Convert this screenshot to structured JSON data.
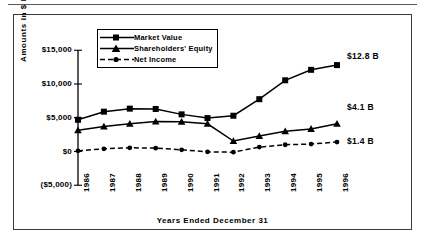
{
  "chart_data": {
    "type": "line",
    "title": "",
    "xlabel": "Years Ended December 31",
    "ylabel": "Amounts  in  $  Millions",
    "categories": [
      "1986",
      "1987",
      "1988",
      "1989",
      "1990",
      "1991",
      "1992",
      "1993",
      "1994",
      "1995",
      "1996"
    ],
    "ylim": [
      -5000,
      15000
    ],
    "yticks": [
      -5000,
      0,
      5000,
      10000,
      15000
    ],
    "ytick_labels": [
      "($5,000)",
      "$0",
      "$5,000",
      "$10,000",
      "$15,000"
    ],
    "grid": false,
    "legend_position": "top-left",
    "series": [
      {
        "name": "Market Value",
        "marker": "square",
        "line_style": "solid",
        "values": [
          4700,
          5900,
          6350,
          6300,
          5500,
          4950,
          5300,
          7750,
          10550,
          12100,
          12800
        ]
      },
      {
        "name": "Shareholders' Equity",
        "marker": "triangle",
        "line_style": "solid",
        "values": [
          3150,
          3700,
          4100,
          4450,
          4400,
          4100,
          1550,
          2300,
          3000,
          3350,
          4100
        ]
      },
      {
        "name": "Net Income",
        "marker": "circle",
        "line_style": "dashed",
        "values": [
          100,
          400,
          550,
          500,
          250,
          -50,
          -100,
          650,
          1000,
          1100,
          1400
        ]
      }
    ],
    "annotations": [
      {
        "text": "$12.8 B",
        "series": "Market Value",
        "at_category": "1996"
      },
      {
        "text": "$4.1 B",
        "series": "Shareholders' Equity",
        "at_category": "1996"
      },
      {
        "text": "$1.4 B",
        "series": "Net Income",
        "at_category": "1996"
      }
    ]
  },
  "legend": {
    "items": [
      {
        "label": "Market Value"
      },
      {
        "label": "Shareholders' Equity"
      },
      {
        "label": "Net Income"
      }
    ]
  },
  "colors": {
    "line": "#000000",
    "frame": "#3b3b3b",
    "background": "#ffffff"
  }
}
